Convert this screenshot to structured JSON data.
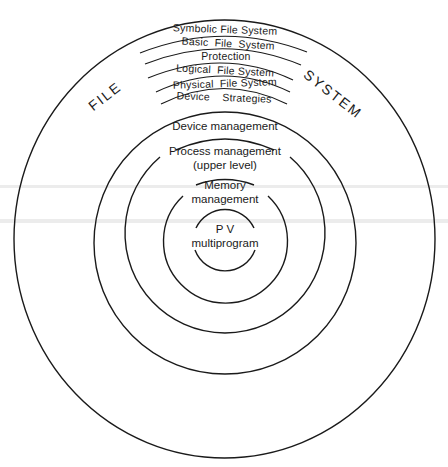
{
  "diagram": {
    "type": "concentric-layers",
    "title_left": "FILE",
    "title_right": "SYSTEM",
    "file_system_bands": [
      {
        "label": "Symbolic File System"
      },
      {
        "label": "Basic  File  System"
      },
      {
        "label": "Protection"
      },
      {
        "label": "Logical  File System"
      },
      {
        "label": "Physical  File System"
      },
      {
        "label": "Device    Strategies"
      }
    ],
    "rings": [
      {
        "id": "device",
        "line1": "Device management",
        "line2": ""
      },
      {
        "id": "process",
        "line1": "Process management",
        "line2": "(upper level)"
      },
      {
        "id": "memory",
        "line1": "Memory",
        "line2": "management"
      },
      {
        "id": "core",
        "line1": "P V",
        "line2": "multiprogram"
      }
    ],
    "colors": {
      "stroke": "#1a1a1a",
      "background": "#ffffff"
    }
  }
}
